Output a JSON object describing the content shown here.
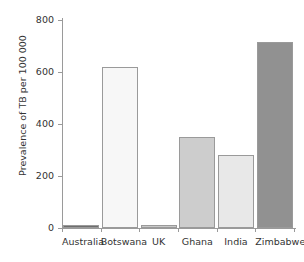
{
  "chart_data": {
    "type": "bar",
    "title": "",
    "xlabel": "",
    "ylabel": "Prevalence of TB per 100 000",
    "categories": [
      "Australia",
      "Botswana",
      "UK",
      "Ghana",
      "India",
      "Zimbabwe"
    ],
    "values": [
      6,
      620,
      10,
      350,
      280,
      715
    ],
    "ylim": [
      0,
      800
    ],
    "yticks": [
      0,
      200,
      400,
      600,
      800
    ],
    "ytick_labels": [
      "0",
      "200",
      "400",
      "600",
      "800"
    ],
    "grid": false,
    "legend": false,
    "bar_colors": [
      "#6e6e6e",
      "#f7f7f7",
      "#c8c8c8",
      "#cdcdcd",
      "#e8e8e8",
      "#919191"
    ],
    "bar_border_color": "#9a9a9a",
    "axis_color": "#9a9a9a",
    "text_color": "#333333",
    "background": "#ffffff"
  }
}
